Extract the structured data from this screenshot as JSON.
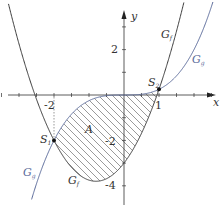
{
  "diagram": {
    "axes": {
      "x_label": "x",
      "y_label": "y",
      "x_range": [
        -3.5,
        2.6
      ],
      "y_range": [
        -4.6,
        3.7
      ],
      "x_tick_step": 0.5,
      "y_tick_step": 1,
      "x_tick_labels": [
        {
          "value": -2,
          "text": "-2"
        },
        {
          "value": 1,
          "text": "1"
        }
      ],
      "y_tick_labels": [
        {
          "value": 2,
          "text": "2"
        },
        {
          "value": -2,
          "text": "-2"
        },
        {
          "value": -4,
          "text": "-4"
        }
      ]
    },
    "curves": [
      {
        "id": "parabola",
        "label": "G",
        "subscript": "f",
        "formula": "y = 1.25x^2 + 2x - 3",
        "color": "#3a3a3a"
      },
      {
        "id": "cubic",
        "label": "G",
        "subscript": "g",
        "formula": "y = 0.25x^3",
        "color": "#5a6a9a"
      }
    ],
    "points": [
      {
        "label": "S",
        "subscript": "1",
        "x": -2,
        "y": -2
      },
      {
        "label": "S",
        "subscript": "2",
        "x": 1,
        "y": 0.25
      }
    ],
    "region": {
      "label": "A",
      "x_from": -2,
      "x_to": 1,
      "hatched": true
    },
    "colors": {
      "axis": "#333333",
      "hatch": "#555555",
      "cubic": "#5a6a9a",
      "parabola": "#3a3a3a"
    }
  }
}
